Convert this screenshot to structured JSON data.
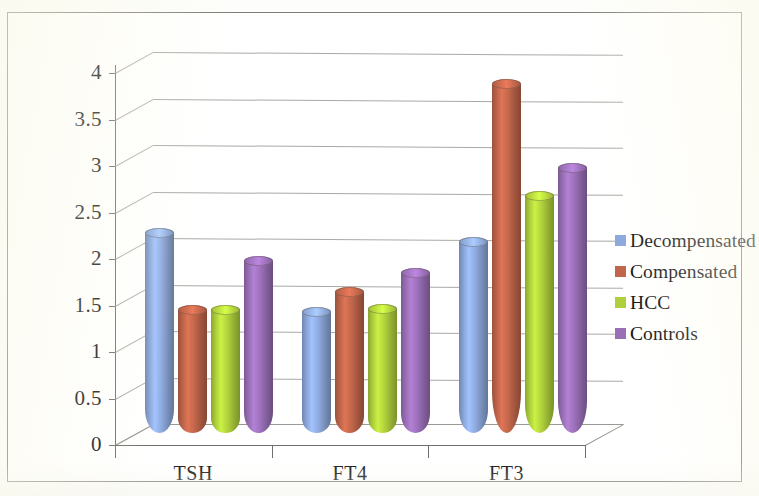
{
  "chart_data": {
    "type": "bar",
    "title": "",
    "subtitle": "",
    "xlabel": "",
    "ylabel": "",
    "categories": [
      "TSH",
      "FT4",
      "FT3"
    ],
    "series": [
      {
        "name": "Decompensated",
        "color": "#8CA8DC",
        "values": [
          2.15,
          1.3,
          2.05
        ]
      },
      {
        "name": "Compensated",
        "color": "#C0654A",
        "values": [
          1.32,
          1.52,
          3.75
        ]
      },
      {
        "name": "HCC",
        "color": "#AFD03C",
        "values": [
          1.32,
          1.33,
          2.55
        ]
      },
      {
        "name": "Controls",
        "color": "#9A6FB8",
        "values": [
          1.85,
          1.72,
          2.85
        ]
      }
    ],
    "ylim": [
      0,
      4
    ],
    "ytick_step": 0.5,
    "ytick_labels": [
      "0",
      "0.5",
      "1",
      "1.5",
      "2",
      "2.5",
      "3",
      "3.5",
      "4"
    ],
    "grid": true,
    "grid_axis": "y",
    "legend_position": "right",
    "style": "3d-cylinder"
  },
  "legend": {
    "items": [
      {
        "label": "Decompensated",
        "color": "#8CA8DC"
      },
      {
        "label": "Compensated",
        "color": "#C0654A"
      },
      {
        "label": "HCC",
        "color": "#AFD03C"
      },
      {
        "label": "Controls",
        "color": "#9A6FB8"
      }
    ]
  }
}
